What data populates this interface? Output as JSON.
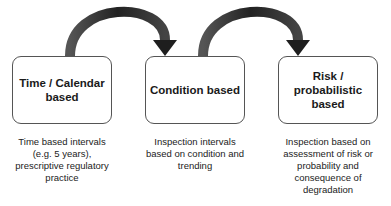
{
  "stages": [
    {
      "title": "Time / Calendar\nbased",
      "description": "Time based intervals\n(e.g. 5 years),\nprescriptive regulatory\npractice"
    },
    {
      "title": "Condition based",
      "description": "Inspection intervals\nbased on condition and\ntrending"
    },
    {
      "title": "Risk /\nprobabilistic\nbased",
      "description": "Inspection based on\nassessment of risk or\nprobability and\nconsequence of\ndegradation"
    }
  ],
  "arrows": [
    {
      "from": 0,
      "to": 1,
      "color": "#2b2b2b"
    },
    {
      "from": 1,
      "to": 2,
      "color": "#2b2b2b"
    }
  ]
}
